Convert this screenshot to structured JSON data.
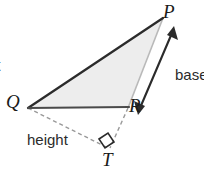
{
  "diagram": {
    "colors": {
      "stroke": "#2b2b2b",
      "fill": "#ededed",
      "light_stroke": "#b4b4b4",
      "dashed": "#8f8f8f",
      "text": "#1a1a1a"
    },
    "vertices": [
      {
        "name": "P",
        "label": "P",
        "x": 163,
        "y": 18
      },
      {
        "name": "Q",
        "label": "Q",
        "x": 28,
        "y": 108
      },
      {
        "name": "R",
        "label": "R",
        "x": 128,
        "y": 108
      },
      {
        "name": "T",
        "label": "T",
        "x": 108,
        "y": 148
      }
    ],
    "labels": {
      "base": "base",
      "height": "height",
      "clipped_left": "t"
    },
    "edges": [
      {
        "name": "QP",
        "from": "Q",
        "to": "P",
        "style": "solid-dark"
      },
      {
        "name": "QR",
        "from": "Q",
        "to": "R",
        "style": "solid-dark"
      },
      {
        "name": "PR",
        "from": "P",
        "to": "R",
        "style": "solid-light"
      },
      {
        "name": "QT",
        "from": "Q",
        "to": "T",
        "style": "dashed"
      },
      {
        "name": "RT",
        "from": "R",
        "to": "T",
        "style": "dashed"
      }
    ],
    "annotations": [
      {
        "name": "base-arrow",
        "type": "double-headed-arrow",
        "from": [
          171,
          30
        ],
        "to": [
          137,
          111
        ],
        "label": "base"
      },
      {
        "name": "right-angle-marker",
        "type": "square",
        "at": [
          105,
          141
        ]
      }
    ]
  }
}
